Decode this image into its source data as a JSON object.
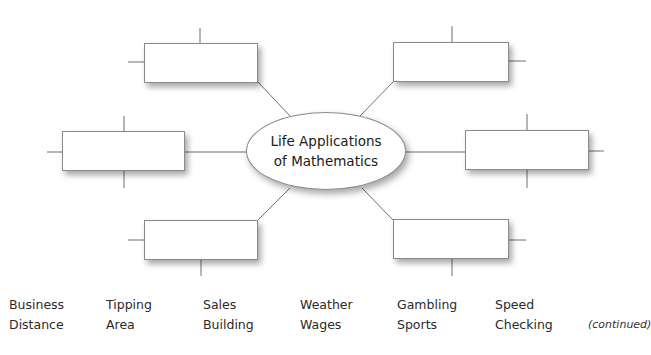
{
  "diagram": {
    "center_label_line1": "Life Applications",
    "center_label_line2": "of Mathematics",
    "boxes": [
      {
        "id": "top-left",
        "text": ""
      },
      {
        "id": "top-right",
        "text": ""
      },
      {
        "id": "middle-left",
        "text": ""
      },
      {
        "id": "middle-right",
        "text": ""
      },
      {
        "id": "bottom-left",
        "text": ""
      },
      {
        "id": "bottom-right",
        "text": ""
      }
    ]
  },
  "word_bank": {
    "row1": [
      "Business",
      "Tipping",
      "Sales",
      "Weather",
      "Gambling",
      "Speed"
    ],
    "row2": [
      "Distance",
      "Area",
      "Building",
      "Wages",
      "Sports",
      "Checking"
    ]
  },
  "footer": {
    "continued": "(continued)"
  },
  "colors": {
    "line": "#6e6e6e",
    "border": "#8a8a8a"
  }
}
